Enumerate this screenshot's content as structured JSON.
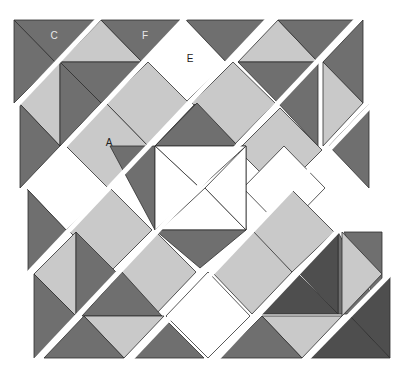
{
  "diagram": {
    "colors": {
      "dark": "#6f6f6f",
      "darker": "#4e4e4e",
      "light": "#c9c9c9",
      "white": "#ffffff",
      "outline": "#2e2e2e",
      "label_light": "#e8e8e8",
      "label_dark": "#222222"
    },
    "labels": [
      {
        "text": "C",
        "x": 54,
        "y": 36,
        "tone": "label_light"
      },
      {
        "text": "F",
        "x": 145,
        "y": 36,
        "tone": "label_light"
      },
      {
        "text": "E",
        "x": 190,
        "y": 59,
        "tone": "label_dark"
      },
      {
        "text": "A",
        "x": 109,
        "y": 143,
        "tone": "label_dark"
      }
    ],
    "pieces": [
      {
        "fill": "dark",
        "points": "14,20 95,20 55,62"
      },
      {
        "fill": "dark",
        "points": "14,20 55,62 14,103"
      },
      {
        "fill": "light",
        "points": "101,20 142,62 60,62"
      },
      {
        "fill": "dark",
        "points": "101,20 180,20 142,62"
      },
      {
        "fill": "dark",
        "points": "186,20 266,20 226,62 "
      },
      {
        "fill": "white",
        "points": "186,20 226,62 185,103 143,62"
      },
      {
        "fill": "light",
        "points": "278,20 318,62 238,62"
      },
      {
        "fill": "dark",
        "points": "278,20 358,20 318,62"
      },
      {
        "fill": "dark",
        "points": "363,20 363,103 323,62"
      },
      {
        "fill": "light",
        "points": "20,104 60,62 60,146"
      },
      {
        "fill": "dark",
        "points": "20,104 60,146 20,188"
      },
      {
        "fill": "dark",
        "points": "60,62 142,62 101,103"
      },
      {
        "fill": "dark",
        "points": "60,62 101,103 60,146"
      },
      {
        "fill": "light",
        "points": "148,62 189,103 148,146 106,103"
      },
      {
        "fill": "light",
        "points": "66,146 106,103 148,146 106,188"
      },
      {
        "fill": "light",
        "points": "233,62 275,103 233,146 192,103"
      },
      {
        "fill": "dark",
        "points": "238,62 318,62 278,103"
      },
      {
        "fill": "dark",
        "points": "318,62 318,146 278,103"
      },
      {
        "fill": "light",
        "points": "323,62 363,103 323,146"
      },
      {
        "fill": "dark",
        "points": "369,104 369,188 329,146"
      },
      {
        "fill": "dark",
        "points": "155,146 195,104 238,146"
      },
      {
        "fill": "dark",
        "points": "197,103 238,146 155,146"
      },
      {
        "fill": "light",
        "points": "280,108 322,150 280,192 238,150"
      },
      {
        "fill": "white",
        "points": "284,146 325,188 284,230 243,188"
      },
      {
        "fill": "white",
        "points": "26,188 66,146 108,188 66,230"
      },
      {
        "fill": "dark",
        "points": "110,146 155,146 155,230 "
      },
      {
        "fill": "dark",
        "points": "238,146 246,146 246,230"
      },
      {
        "fill": "white",
        "points": "155,146 246,146 200,188"
      },
      {
        "fill": "white",
        "points": "155,146 200,188 155,230"
      },
      {
        "fill": "white",
        "points": "160,230 205,188 246,230"
      },
      {
        "fill": "white",
        "points": "246,146 246,230 205,188"
      },
      {
        "fill": "dark",
        "points": "155,230 246,230 200,268"
      },
      {
        "fill": "dark",
        "points": "28,190 68,232 28,272"
      },
      {
        "fill": "light",
        "points": "110,188 152,230 110,272 68,230"
      },
      {
        "fill": "light",
        "points": "156,232 196,272 156,314 116,272"
      },
      {
        "fill": "light",
        "points": "292,190 334,232 292,272 250,232"
      },
      {
        "fill": "light",
        "points": "252,230 292,272 252,314 212,272"
      },
      {
        "fill": "dark",
        "points": "344,232 382,232 382,314"
      },
      {
        "fill": "dark",
        "points": "338,232 382,314 338,314"
      },
      {
        "fill": "light",
        "points": "34,274 76,232 76,316"
      },
      {
        "fill": "dark",
        "points": "34,274 76,316 34,358"
      },
      {
        "fill": "dark",
        "points": "76,232 116,272 76,316"
      },
      {
        "fill": "dark",
        "points": "82,316 162,316 122,272"
      },
      {
        "fill": "white",
        "points": "208,272 250,316 208,358 166,316"
      },
      {
        "fill": "darker",
        "points": "338,232 338,314 298,272"
      },
      {
        "fill": "darker",
        "points": "298,274 338,314 258,314"
      },
      {
        "fill": "light",
        "points": "342,232 382,274 342,316"
      },
      {
        "fill": "light",
        "points": "84,316 164,316 124,358"
      },
      {
        "fill": "dark",
        "points": "44,358 84,316 124,358"
      },
      {
        "fill": "light",
        "points": "262,316 342,316 302,358"
      },
      {
        "fill": "dark",
        "points": "220,358 262,316 302,358"
      },
      {
        "fill": "darker",
        "points": "390,276 390,358 350,316"
      },
      {
        "fill": "darker",
        "points": "310,358 350,316 390,358"
      },
      {
        "fill": "dark",
        "points": "130,358 166,320 204,358"
      }
    ],
    "gaps": [
      {
        "x1": 14,
        "y1": 108,
        "x2": 103,
        "y2": 14
      },
      {
        "x1": 20,
        "y1": 193,
        "x2": 187,
        "y2": 16
      },
      {
        "x1": 26,
        "y1": 276,
        "x2": 273,
        "y2": 14
      },
      {
        "x1": 34,
        "y1": 362,
        "x2": 360,
        "y2": 16
      },
      {
        "x1": 128,
        "y1": 362,
        "x2": 372,
        "y2": 104
      },
      {
        "x1": 214,
        "y1": 362,
        "x2": 378,
        "y2": 188
      },
      {
        "x1": 304,
        "y1": 362,
        "x2": 392,
        "y2": 272
      }
    ]
  }
}
